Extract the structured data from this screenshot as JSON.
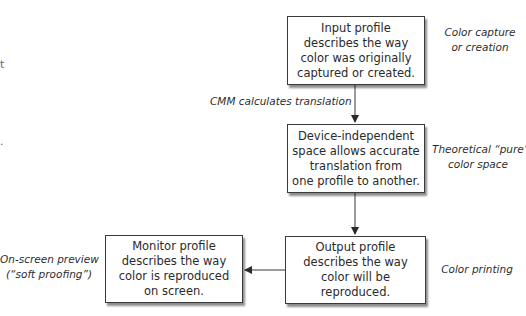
{
  "diagram": {
    "type": "flowchart",
    "nodes": [
      {
        "id": "input-profile",
        "lines": [
          "Input profile",
          "describes the way",
          "color was originally",
          "captured or created."
        ],
        "side_label": [
          "Color capture",
          "or creation"
        ]
      },
      {
        "id": "device-independent-space",
        "lines": [
          "Device-independent",
          "space allows accurate",
          "translation from",
          "one profile to another."
        ],
        "side_label": [
          "Theoretical “pure”",
          "color space"
        ]
      },
      {
        "id": "output-profile",
        "lines": [
          "Output profile",
          "describes the way",
          "color will be",
          "reproduced."
        ],
        "side_label": [
          "Color printing"
        ]
      },
      {
        "id": "monitor-profile",
        "lines": [
          "Monitor profile",
          "describes the way",
          "color is reproduced",
          "on screen."
        ],
        "side_label": [
          "On-screen preview",
          "(“soft proofing”)"
        ]
      }
    ],
    "edges": [
      {
        "from": "input-profile",
        "to": "device-independent-space",
        "label": "CMM calculates translation"
      },
      {
        "from": "device-independent-space",
        "to": "output-profile",
        "label": ""
      },
      {
        "from": "output-profile",
        "to": "monitor-profile",
        "label": ""
      }
    ],
    "colors": {
      "line": "#3a3a3a",
      "box_fill": "#ffffff",
      "background": "#ffffff"
    }
  }
}
